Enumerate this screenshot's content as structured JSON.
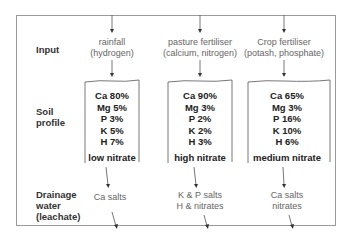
{
  "rows": {
    "input": "Input",
    "soil_profile": [
      "Soil",
      "profile"
    ],
    "drainage": [
      "Drainage",
      "water",
      "(leachate)"
    ]
  },
  "columns": [
    {
      "input": [
        "rainfall",
        "(hydrogen)"
      ],
      "profile": [
        "Ca 80%",
        "Mg 5%",
        "P 3%",
        "K 5%",
        "H 7%"
      ],
      "nitrate": "low nitrate",
      "drainage": [
        "Ca salts"
      ]
    },
    {
      "input": [
        "pasture fertiliser",
        "(calcium, nitrogen)"
      ],
      "profile": [
        "Ca 90%",
        "Mg 3%",
        "P 2%",
        "K 2%",
        "H 3%"
      ],
      "nitrate": "high nitrate",
      "drainage": [
        "K & P salts",
        "H & nitrates"
      ]
    },
    {
      "input": [
        "Crop fertiliser",
        "(potash, phosphate)"
      ],
      "profile": [
        "Ca 65%",
        "Mg 3%",
        "P 16%",
        "K 10%",
        "H 6%"
      ],
      "nitrate": "medium nitrate",
      "drainage": [
        "Ca salts",
        "nitrates"
      ]
    }
  ],
  "colors": {
    "frame": "#9a9a9a",
    "lines": "#555555",
    "label_text": "#333333",
    "light_text": "#666666"
  }
}
